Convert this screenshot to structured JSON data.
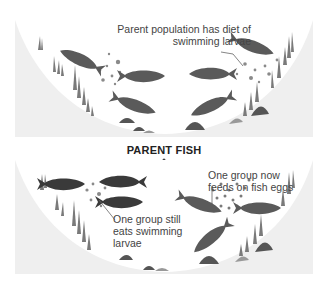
{
  "top_panel": {
    "caption": "Parent population has diet of swimming larvae"
  },
  "divider": {
    "label": "PARENT FISH",
    "arrow_icon": "dotted-down-arrow-icon"
  },
  "bottom_panel": {
    "caption_left": "One group still eats swimming larvae",
    "caption_right": "One group now feeds on fish eggs"
  },
  "colors": {
    "panel_bg": "#efefef",
    "bowl": "#ffffff",
    "fish_medium": "#5a5a5a",
    "fish_dark": "#3a3a3a",
    "plants": "#777777",
    "rocks": "#555555",
    "text": "#444444"
  }
}
